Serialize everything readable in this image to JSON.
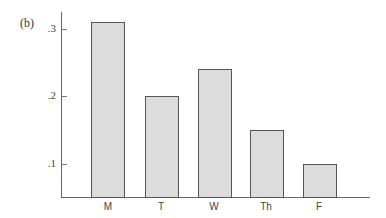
{
  "panel_label": "(b)",
  "chart_data": {
    "type": "bar",
    "title": "",
    "panel": "(b)",
    "xlabel": "",
    "ylabel": "",
    "categories": [
      "M",
      "T",
      "W",
      "Th",
      "F"
    ],
    "values": [
      0.31,
      0.2,
      0.24,
      0.15,
      0.1
    ],
    "yticks": [
      ".3",
      ".2",
      ".1"
    ],
    "ytick_values": [
      0.3,
      0.2,
      0.1
    ],
    "ylim": [
      0.05,
      0.33
    ],
    "grid": false,
    "legend": null,
    "bar_fill": "#dcdcdc",
    "bar_edge": "#555555"
  }
}
